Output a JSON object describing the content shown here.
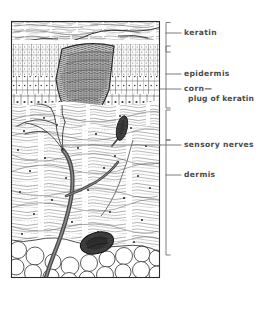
{
  "figure": {
    "ink_color": "#3a3a3a",
    "label_color": "#4a4a4a",
    "background": "#ffffff",
    "labels": [
      {
        "id": "keratin",
        "text": "keratin",
        "text2": ""
      },
      {
        "id": "epidermis",
        "text": "epidermis",
        "text2": ""
      },
      {
        "id": "corn",
        "text": "corn—",
        "text2": "plug of keratin"
      },
      {
        "id": "nerves",
        "text": "sensory nerves",
        "text2": ""
      },
      {
        "id": "dermis",
        "text": "dermis",
        "text2": ""
      }
    ],
    "layers": [
      {
        "id": "keratin-layer",
        "name": "keratin"
      },
      {
        "id": "epidermis-layer",
        "name": "epidermis"
      },
      {
        "id": "corn-plug",
        "name": "corn—plug of keratin"
      },
      {
        "id": "dermis-layer",
        "name": "dermis"
      },
      {
        "id": "fat-layer",
        "name": "subcutaneous fat"
      }
    ],
    "structures": [
      {
        "id": "nerve-trunk",
        "name": "sensory nerve trunk"
      },
      {
        "id": "corpuscle-small",
        "name": "sensory corpuscle"
      },
      {
        "id": "corpuscle-large",
        "name": "pacinian corpuscle"
      }
    ]
  }
}
